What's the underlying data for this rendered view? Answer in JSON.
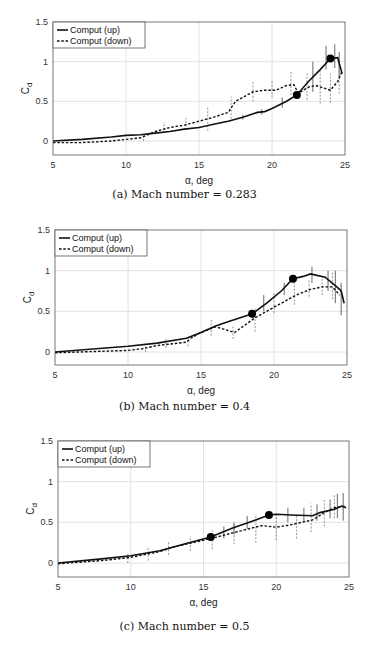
{
  "chart_data": [
    {
      "type": "line",
      "caption": "(a) Mach number = 0.283",
      "title": "",
      "xlabel": "α, deg",
      "ylabel": "Cd",
      "xlim": [
        5,
        25
      ],
      "ylim": [
        -0.17,
        1.5
      ],
      "xticks": [
        5,
        10,
        15,
        20,
        25
      ],
      "yticks": [
        0,
        0.5,
        1,
        1.5
      ],
      "grid": true,
      "legend_position": "upper-left",
      "series": [
        {
          "name": "Comput (up)",
          "style": "solid",
          "x": [
            5,
            7,
            9,
            10,
            11,
            12,
            13,
            14,
            15,
            16,
            17,
            18,
            19,
            19.5,
            20,
            21,
            21.7,
            22.5,
            23.3,
            24,
            24.5,
            24.8
          ],
          "y": [
            0,
            0.02,
            0.05,
            0.07,
            0.08,
            0.1,
            0.12,
            0.15,
            0.17,
            0.21,
            0.25,
            0.3,
            0.36,
            0.37,
            0.41,
            0.5,
            0.58,
            0.75,
            0.9,
            1.04,
            1.05,
            0.85
          ]
        },
        {
          "name": "Comput (down)",
          "style": "dashed",
          "x": [
            5,
            7,
            9,
            10,
            11,
            12,
            13,
            14,
            15,
            16,
            17,
            17.5,
            18,
            18.7,
            19.5,
            20.3,
            21,
            21.5,
            21.8,
            22.5,
            23,
            24,
            24.5,
            24.8
          ],
          "y": [
            -0.02,
            -0.02,
            0,
            0.02,
            0.04,
            0.12,
            0.17,
            0.2,
            0.25,
            0.3,
            0.36,
            0.5,
            0.55,
            0.62,
            0.64,
            0.64,
            0.7,
            0.71,
            0.6,
            0.68,
            0.7,
            0.64,
            0.75,
            0.88
          ]
        }
      ],
      "markers": [
        {
          "x": 21.7,
          "y": 0.58
        },
        {
          "x": 24.0,
          "y": 1.04
        }
      ],
      "errorbars": [
        {
          "series": 0,
          "x": 18,
          "lo": 0.27,
          "hi": 0.33
        },
        {
          "series": 0,
          "x": 19.3,
          "lo": 0.33,
          "hi": 0.4
        },
        {
          "series": 0,
          "x": 20.7,
          "lo": 0.42,
          "hi": 0.55
        },
        {
          "series": 0,
          "x": 22.8,
          "lo": 0.62,
          "hi": 1.0
        },
        {
          "series": 0,
          "x": 23.7,
          "lo": 0.9,
          "hi": 1.2
        },
        {
          "series": 0,
          "x": 24.3,
          "lo": 0.92,
          "hi": 1.22
        },
        {
          "series": 0,
          "x": 24.6,
          "lo": 0.8,
          "hi": 1.12
        },
        {
          "series": 1,
          "x": 11.2,
          "lo": 0.0,
          "hi": 0.08
        },
        {
          "series": 1,
          "x": 12.6,
          "lo": 0.1,
          "hi": 0.24
        },
        {
          "series": 1,
          "x": 14.1,
          "lo": 0.14,
          "hi": 0.29
        },
        {
          "series": 1,
          "x": 15.6,
          "lo": 0.13,
          "hi": 0.44
        },
        {
          "series": 1,
          "x": 17.2,
          "lo": 0.28,
          "hi": 0.56
        },
        {
          "series": 1,
          "x": 18.7,
          "lo": 0.5,
          "hi": 0.75
        },
        {
          "series": 1,
          "x": 20.0,
          "lo": 0.55,
          "hi": 0.76
        },
        {
          "series": 1,
          "x": 21.3,
          "lo": 0.58,
          "hi": 0.87
        },
        {
          "series": 1,
          "x": 22.4,
          "lo": 0.52,
          "hi": 0.85
        },
        {
          "series": 1,
          "x": 23.3,
          "lo": 0.47,
          "hi": 0.88
        },
        {
          "series": 1,
          "x": 24.0,
          "lo": 0.48,
          "hi": 0.85
        },
        {
          "series": 1,
          "x": 24.6,
          "lo": 0.6,
          "hi": 1.05
        }
      ]
    },
    {
      "type": "line",
      "caption": "(b) Mach number = 0.4",
      "title": "",
      "xlabel": "α, deg",
      "ylabel": "Cd",
      "xlim": [
        5,
        25
      ],
      "ylim": [
        -0.17,
        1.5
      ],
      "xticks": [
        5,
        10,
        15,
        20,
        25
      ],
      "yticks": [
        0,
        0.5,
        1,
        1.5
      ],
      "grid": true,
      "legend_position": "upper-left",
      "series": [
        {
          "name": "Comput (up)",
          "style": "solid",
          "x": [
            5,
            10,
            12,
            14,
            15,
            16,
            17,
            18,
            18.5,
            19.5,
            20.5,
            21.3,
            22,
            22.5,
            23.5,
            24.3,
            24.6,
            24.8
          ],
          "y": [
            0,
            0.07,
            0.11,
            0.17,
            0.24,
            0.32,
            0.38,
            0.44,
            0.47,
            0.6,
            0.75,
            0.9,
            0.93,
            0.96,
            0.92,
            0.8,
            0.75,
            0.6
          ]
        },
        {
          "name": "Comput (down)",
          "style": "dashed",
          "x": [
            5,
            10,
            11,
            12,
            14,
            14.3,
            15,
            16,
            17.3,
            18,
            18.7,
            19.5,
            20.5,
            21.5,
            22.5,
            23.3,
            24,
            24.5
          ],
          "y": [
            -0.01,
            0.02,
            0.04,
            0.08,
            0.12,
            0.17,
            0.24,
            0.31,
            0.24,
            0.33,
            0.42,
            0.5,
            0.6,
            0.7,
            0.77,
            0.8,
            0.8,
            0.7
          ]
        }
      ],
      "markers": [
        {
          "x": 18.5,
          "y": 0.47
        },
        {
          "x": 21.3,
          "y": 0.9
        }
      ],
      "errorbars": [
        {
          "series": 0,
          "x": 19.3,
          "lo": 0.5,
          "hi": 0.7
        },
        {
          "series": 0,
          "x": 20.7,
          "lo": 0.7,
          "hi": 0.85
        },
        {
          "series": 0,
          "x": 22.6,
          "lo": 0.85,
          "hi": 1.05
        },
        {
          "series": 0,
          "x": 23.7,
          "lo": 0.75,
          "hi": 1.0
        },
        {
          "series": 0,
          "x": 24.2,
          "lo": 0.6,
          "hi": 1.0
        },
        {
          "series": 0,
          "x": 24.6,
          "lo": 0.45,
          "hi": 0.85
        },
        {
          "series": 1,
          "x": 11.2,
          "lo": 0.0,
          "hi": 0.08
        },
        {
          "series": 1,
          "x": 12.6,
          "lo": 0.05,
          "hi": 0.17
        },
        {
          "series": 1,
          "x": 14.1,
          "lo": 0.07,
          "hi": 0.2
        },
        {
          "series": 1,
          "x": 15.7,
          "lo": 0.2,
          "hi": 0.4
        },
        {
          "series": 1,
          "x": 17.2,
          "lo": 0.16,
          "hi": 0.32
        },
        {
          "series": 1,
          "x": 18.7,
          "lo": 0.25,
          "hi": 0.55
        },
        {
          "series": 1,
          "x": 20.0,
          "lo": 0.48,
          "hi": 0.72
        },
        {
          "series": 1,
          "x": 21.4,
          "lo": 0.58,
          "hi": 0.85
        },
        {
          "series": 1,
          "x": 22.4,
          "lo": 0.68,
          "hi": 0.88
        },
        {
          "series": 1,
          "x": 23.3,
          "lo": 0.7,
          "hi": 0.9
        },
        {
          "series": 1,
          "x": 24.0,
          "lo": 0.65,
          "hi": 0.98
        }
      ]
    },
    {
      "type": "line",
      "caption": "(c) Mach number = 0.5",
      "title": "",
      "xlabel": "α, deg",
      "ylabel": "Cd",
      "xlim": [
        5,
        25
      ],
      "ylim": [
        -0.17,
        1.5
      ],
      "xticks": [
        5,
        10,
        15,
        20,
        25
      ],
      "yticks": [
        0,
        0.5,
        1,
        1.5
      ],
      "grid": true,
      "legend_position": "upper-left",
      "series": [
        {
          "name": "Comput (up)",
          "style": "solid",
          "x": [
            5,
            8,
            10,
            12,
            13,
            14,
            15.5,
            17,
            18,
            19.5,
            20,
            21,
            22.5,
            23,
            24,
            24.5,
            24.8
          ],
          "y": [
            0,
            0.05,
            0.09,
            0.15,
            0.2,
            0.25,
            0.32,
            0.43,
            0.49,
            0.59,
            0.6,
            0.59,
            0.58,
            0.62,
            0.66,
            0.7,
            0.68
          ]
        },
        {
          "name": "Comput (down)",
          "style": "dashed",
          "x": [
            5,
            8,
            10,
            12,
            13,
            15.5,
            17,
            19,
            20,
            21,
            22.5,
            23.3,
            24,
            24.8
          ],
          "y": [
            -0.01,
            0.03,
            0.07,
            0.14,
            0.2,
            0.3,
            0.37,
            0.46,
            0.44,
            0.47,
            0.53,
            0.62,
            0.68,
            0.7
          ]
        }
      ],
      "markers": [
        {
          "x": 15.5,
          "y": 0.32
        },
        {
          "x": 19.5,
          "y": 0.59
        }
      ],
      "errorbars": [
        {
          "series": 0,
          "x": 16.4,
          "lo": 0.3,
          "hi": 0.45
        },
        {
          "series": 0,
          "x": 17.1,
          "lo": 0.35,
          "hi": 0.5
        },
        {
          "series": 0,
          "x": 18.0,
          "lo": 0.42,
          "hi": 0.58
        },
        {
          "series": 0,
          "x": 20.8,
          "lo": 0.5,
          "hi": 0.68
        },
        {
          "series": 0,
          "x": 21.9,
          "lo": 0.5,
          "hi": 0.68
        },
        {
          "series": 0,
          "x": 22.8,
          "lo": 0.52,
          "hi": 0.72
        },
        {
          "series": 0,
          "x": 23.7,
          "lo": 0.55,
          "hi": 0.78
        },
        {
          "series": 0,
          "x": 24.2,
          "lo": 0.55,
          "hi": 0.85
        },
        {
          "series": 0,
          "x": 24.6,
          "lo": 0.52,
          "hi": 0.86
        },
        {
          "series": 1,
          "x": 9.8,
          "lo": 0.0,
          "hi": 0.12
        },
        {
          "series": 1,
          "x": 11.2,
          "lo": 0.03,
          "hi": 0.2
        },
        {
          "series": 1,
          "x": 12.6,
          "lo": 0.1,
          "hi": 0.27
        },
        {
          "series": 1,
          "x": 14.1,
          "lo": 0.15,
          "hi": 0.33
        },
        {
          "series": 1,
          "x": 15.6,
          "lo": 0.17,
          "hi": 0.4
        },
        {
          "series": 1,
          "x": 17.1,
          "lo": 0.23,
          "hi": 0.48
        },
        {
          "series": 1,
          "x": 18.6,
          "lo": 0.25,
          "hi": 0.6
        },
        {
          "series": 1,
          "x": 20.0,
          "lo": 0.28,
          "hi": 0.6
        },
        {
          "series": 1,
          "x": 21.4,
          "lo": 0.3,
          "hi": 0.6
        },
        {
          "series": 1,
          "x": 22.4,
          "lo": 0.38,
          "hi": 0.73
        },
        {
          "series": 1,
          "x": 23.3,
          "lo": 0.45,
          "hi": 0.78
        },
        {
          "series": 1,
          "x": 24.0,
          "lo": 0.55,
          "hi": 0.85
        }
      ]
    }
  ],
  "panels": [
    {
      "caption": "(a) Mach number = 0.283"
    },
    {
      "caption": "(b) Mach number = 0.4"
    },
    {
      "caption": "(c) Mach number = 0.5"
    }
  ],
  "legend": {
    "up": "Comput (up)",
    "down": "Comput (down)"
  },
  "axis": {
    "xlabel": "α, deg",
    "ylabel_main": "C",
    "ylabel_sub": "d"
  }
}
